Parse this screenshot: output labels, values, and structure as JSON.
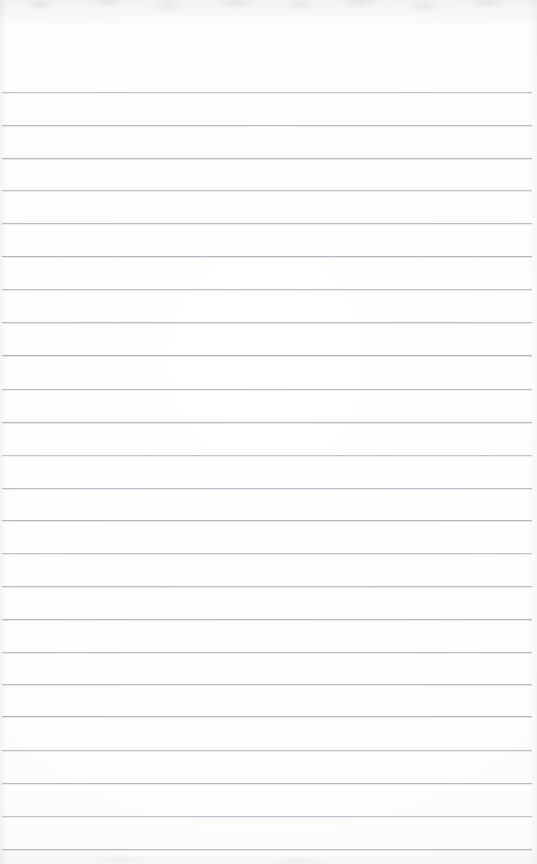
{
  "document": {
    "kind": "scanned-ruled-notebook-page",
    "title": "Blank lined notebook page",
    "orientation": "portrait",
    "page_width": 537,
    "page_height": 864,
    "has_text_content": false,
    "has_handwriting": false,
    "has_margin_line": false,
    "has_header": false,
    "has_page_number": false,
    "text_content": ""
  },
  "paper": {
    "background_color": "#fcfcfd",
    "highlight_color": "#ffffff",
    "shadow_color": "#f9f9fb"
  },
  "ruling": {
    "line_color": "#9fa2ad",
    "line_secondary_color": "#c9cbd3",
    "line_thickness": 1,
    "line_spacing": 32.7,
    "first_line_y": 92,
    "line_count": 24,
    "line_left_x": 2,
    "line_right_x": 532,
    "lines_y": [
      92,
      125,
      158,
      190,
      223,
      256,
      289,
      322,
      355,
      389,
      422,
      455,
      488,
      520,
      553,
      586,
      619,
      652,
      684,
      716,
      750,
      783,
      816,
      849
    ]
  },
  "scan_artifacts": {
    "top_edge_smudge": true,
    "bottom_edge_smudge": true,
    "artifact_color": "#96969e"
  }
}
